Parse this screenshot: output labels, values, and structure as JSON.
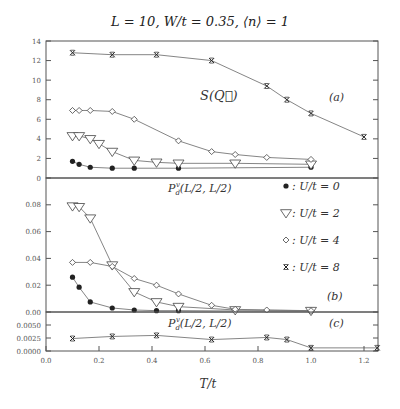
{
  "title": "L = 10, W/t = 0.35, ⟨n⟩ = 1",
  "chart_data": [
    {
      "panel": "(a)",
      "type": "line",
      "label": "S(Q⃗)",
      "xlabel": "T/t",
      "ylabel": "",
      "xlim": [
        0.0,
        1.25
      ],
      "ylim": [
        0,
        14
      ],
      "yticks": [
        0,
        2,
        4,
        6,
        8,
        10,
        12,
        14
      ],
      "ytick_labels": [
        "0",
        "2",
        "4",
        "6",
        "8",
        "10",
        "12",
        "14"
      ],
      "grid": false,
      "series": [
        {
          "name": "U/t = 0",
          "marker": "filled-circle",
          "x": [
            0.1,
            0.125,
            0.167,
            0.25,
            0.333,
            0.5,
            1.0
          ],
          "values": [
            1.7,
            1.4,
            1.1,
            1.0,
            1.0,
            1.0,
            1.1
          ]
        },
        {
          "name": "U/t = 2",
          "marker": "open-triangle-down",
          "x": [
            0.1,
            0.125,
            0.167,
            0.2,
            0.25,
            0.333,
            0.417,
            0.5,
            0.714,
            1.0
          ],
          "values": [
            4.3,
            4.3,
            4.0,
            3.5,
            2.7,
            1.8,
            1.6,
            1.5,
            1.5,
            1.4
          ]
        },
        {
          "name": "U/t = 4",
          "marker": "open-diamond",
          "x": [
            0.1,
            0.125,
            0.167,
            0.25,
            0.333,
            0.5,
            0.625,
            0.714,
            0.833,
            1.0
          ],
          "values": [
            6.9,
            6.9,
            6.9,
            6.8,
            6.0,
            3.8,
            2.7,
            2.4,
            2.1,
            1.9
          ]
        },
        {
          "name": "U/t = 8",
          "marker": "cross",
          "x": [
            0.1,
            0.25,
            0.417,
            0.625,
            0.833,
            0.909,
            1.0,
            1.2
          ],
          "values": [
            12.8,
            12.6,
            12.6,
            12.0,
            9.4,
            8.0,
            6.6,
            4.2
          ]
        }
      ]
    },
    {
      "panel": "(b)",
      "type": "line",
      "label": "P_d^v(L/2, L/2)",
      "xlim": [
        0.0,
        1.25
      ],
      "ylim": [
        0.0,
        0.1
      ],
      "yticks": [
        0.0,
        0.02,
        0.04,
        0.06,
        0.08
      ],
      "ytick_labels": [
        "0.00",
        "0.02",
        "0.04",
        "0.06",
        "0.08"
      ],
      "grid": false,
      "series": [
        {
          "name": "U/t = 0",
          "marker": "filled-circle",
          "x": [
            0.1,
            0.125,
            0.167,
            0.25,
            0.333,
            0.417,
            0.5,
            1.0
          ],
          "values": [
            0.026,
            0.0185,
            0.0075,
            0.003,
            0.0015,
            0.001,
            0.001,
            0.0005
          ]
        },
        {
          "name": "U/t = 2",
          "marker": "open-triangle-down",
          "x": [
            0.1,
            0.125,
            0.167,
            0.25,
            0.333,
            0.417,
            0.5,
            0.714,
            1.0
          ],
          "values": [
            0.079,
            0.0785,
            0.07,
            0.035,
            0.015,
            0.0075,
            0.004,
            0.0015,
            0.001
          ]
        },
        {
          "name": "U/t = 4",
          "marker": "open-diamond",
          "x": [
            0.1,
            0.167,
            0.25,
            0.333,
            0.417,
            0.5,
            0.625,
            0.714,
            0.833,
            1.0
          ],
          "values": [
            0.037,
            0.037,
            0.034,
            0.025,
            0.02,
            0.0135,
            0.005,
            0.002,
            0.0015,
            0.001
          ]
        }
      ]
    },
    {
      "panel": "(c)",
      "type": "line",
      "label": "P_d^v(L/2, L/2)",
      "xlabel": "T/t",
      "xlim": [
        0.0,
        1.25
      ],
      "ylim": [
        0.0,
        0.0075
      ],
      "yticks": [
        0.0,
        0.0025,
        0.005
      ],
      "ytick_labels": [
        "0.0000",
        "0.0025",
        "0.0050"
      ],
      "xticks": [
        0.0,
        0.2,
        0.4,
        0.6,
        0.8,
        1.0,
        1.2
      ],
      "xtick_labels": [
        "0.0",
        "0.2",
        "0.4",
        "0.6",
        "0.8",
        "1.0",
        "1.2"
      ],
      "grid": false,
      "series": [
        {
          "name": "U/t = 8",
          "marker": "cross",
          "x": [
            0.1,
            0.25,
            0.417,
            0.625,
            0.833,
            0.909,
            1.0,
            1.25
          ],
          "values": [
            0.0024,
            0.0028,
            0.003,
            0.0022,
            0.0026,
            0.0022,
            0.0006,
            0.0006
          ]
        }
      ]
    }
  ],
  "legend": {
    "position": "right of panel (b)",
    "entries": [
      {
        "marker": "filled-circle",
        "symbol": "●",
        "label": ": U/t = 0"
      },
      {
        "marker": "open-triangle-down",
        "symbol": "▽",
        "label": ": U/t = 2"
      },
      {
        "marker": "open-diamond",
        "symbol": "◇",
        "label": ": U/t = 4"
      },
      {
        "marker": "cross",
        "symbol": "×",
        "label": ": U/t = 8"
      }
    ]
  },
  "annotations": {
    "panel_a_label": "S(Q⃗)",
    "panel_a_tag": "(a)",
    "panel_b_label": "P",
    "panel_b_sub": "d",
    "panel_b_sup": "v",
    "panel_b_args": "(L/2, L/2)",
    "panel_b_tag": "(b)",
    "panel_c_label": "P",
    "panel_c_sub": "d",
    "panel_c_sup": "v",
    "panel_c_args": "(L/2, L/2)",
    "panel_c_tag": "(c)",
    "xlabel": "T/t"
  },
  "colors": {
    "line": "#777777",
    "marker": "#222222",
    "frame": "#555555"
  }
}
